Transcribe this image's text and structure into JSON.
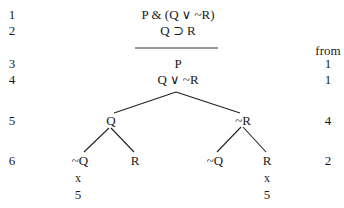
{
  "line_numbers": [
    "1",
    "2",
    "3",
    "4",
    "5",
    "6"
  ],
  "premises": [
    "P & (Q ∨ ~R)",
    "Q ⊃ R"
  ],
  "derived": [
    "P",
    "Q ∨ ~R"
  ],
  "from_header": "from",
  "from_values": [
    "1",
    "1",
    "4",
    "2"
  ],
  "branches_level5": [
    "Q",
    "~R"
  ],
  "branches_level6": [
    "~Q",
    "R",
    "~Q",
    "R"
  ],
  "closures": [
    {
      "mark": "x",
      "ref": "5"
    },
    {
      "mark": "x",
      "ref": "5"
    }
  ]
}
